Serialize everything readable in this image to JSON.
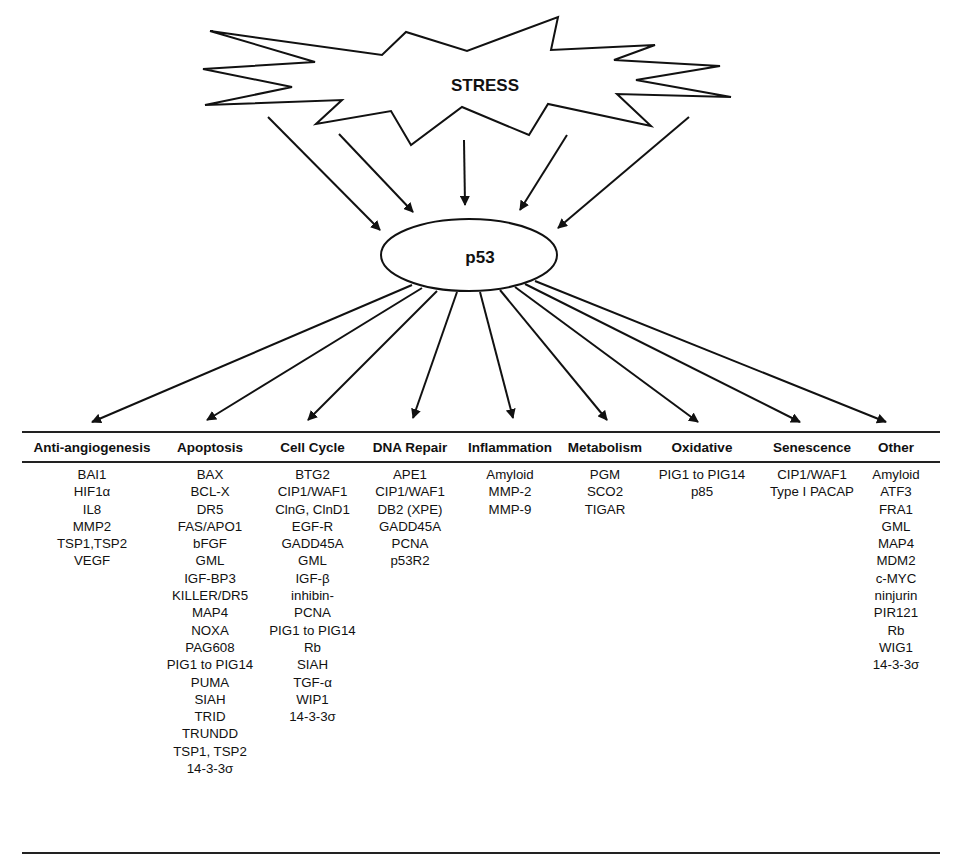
{
  "diagram": {
    "source_node": "STRESS",
    "center_node": "p53",
    "colors": {
      "line": "#111111",
      "background": "#ffffff"
    }
  },
  "table": {
    "columns": [
      {
        "header": "Anti-angiogenesis",
        "items": [
          "BAI1",
          "HIF1α",
          "IL8",
          "MMP2",
          "TSP1,TSP2",
          "VEGF"
        ]
      },
      {
        "header": "Apoptosis",
        "items": [
          "BAX",
          "BCL-X",
          "DR5",
          "FAS/APO1",
          "bFGF",
          "GML",
          "IGF-BP3",
          "KILLER/DR5",
          "MAP4",
          "NOXA",
          "PAG608",
          "PIG1 to PIG14",
          "PUMA",
          "SIAH",
          "TRID",
          "TRUNDD",
          "TSP1, TSP2",
          "14-3-3σ"
        ]
      },
      {
        "header": "Cell Cycle",
        "items": [
          "BTG2",
          "CIP1/WAF1",
          "ClnG, ClnD1",
          "EGF-R",
          "GADD45A",
          "GML",
          "IGF-β",
          "inhibin-",
          "PCNA",
          "PIG1 to PIG14",
          "Rb",
          "SIAH",
          "TGF-α",
          "WIP1",
          "14-3-3σ"
        ]
      },
      {
        "header": "DNA Repair",
        "items": [
          "APE1",
          "CIP1/WAF1",
          "DB2 (XPE)",
          "GADD45A",
          "PCNA",
          "p53R2"
        ]
      },
      {
        "header": "Inflammation",
        "items": [
          "Amyloid",
          "MMP-2",
          "MMP-9"
        ]
      },
      {
        "header": "Metabolism",
        "items": [
          "PGM",
          "SCO2",
          "TIGAR"
        ]
      },
      {
        "header": "Oxidative",
        "items": [
          "PIG1 to PIG14",
          "p85"
        ]
      },
      {
        "header": "Senescence",
        "items": [
          "CIP1/WAF1",
          "Type I PACAP"
        ]
      },
      {
        "header": "Other",
        "items": [
          "Amyloid",
          "ATF3",
          "FRA1",
          "GML",
          "MAP4",
          "MDM2",
          "c-MYC",
          "ninjurin",
          "PIR121",
          "Rb",
          "WIG1",
          "14-3-3σ"
        ]
      }
    ]
  }
}
